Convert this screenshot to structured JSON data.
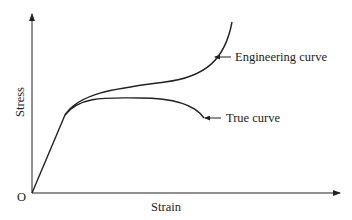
{
  "diagram": {
    "axes": {
      "x_label": "Strain",
      "y_label": "Stress",
      "origin_label": "O"
    },
    "curves": [
      {
        "name": "engineering",
        "label": "Engineering curve"
      },
      {
        "name": "true",
        "label": "True curve"
      }
    ],
    "colors": {
      "line": "#222222",
      "background": "#ffffff"
    }
  }
}
